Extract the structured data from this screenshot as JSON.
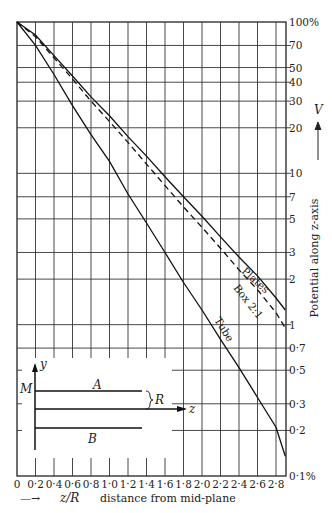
{
  "chart_data": {
    "type": "line",
    "title": "",
    "xlabel": "z/R  distance from mid-plane",
    "xlabel_parts": {
      "arrow": "—→",
      "var": "z/R",
      "text": "distance from mid-plane"
    },
    "ylabel": "Potential along z-axis",
    "ylabel_var": "V",
    "yscale": "log",
    "xlim": [
      0,
      2.9
    ],
    "ylim": [
      0.1,
      100
    ],
    "grid": true,
    "x_ticks": [
      "0",
      "0·2",
      "0·4",
      "0·6",
      "0·8",
      "1·0",
      "1·2",
      "1·4",
      "1·6",
      "1·8",
      "2·0",
      "2·2",
      "2·4",
      "2·6",
      "2·8"
    ],
    "x_tick_values": [
      0,
      0.2,
      0.4,
      0.6,
      0.8,
      1.0,
      1.2,
      1.4,
      1.6,
      1.8,
      2.0,
      2.2,
      2.4,
      2.6,
      2.8
    ],
    "y_ticks": [
      {
        "value": 100,
        "label": "100%"
      },
      {
        "value": 70,
        "label": "70"
      },
      {
        "value": 50,
        "label": "50"
      },
      {
        "value": 40,
        "label": "40"
      },
      {
        "value": 30,
        "label": "30"
      },
      {
        "value": 20,
        "label": "20"
      },
      {
        "value": 10,
        "label": "10"
      },
      {
        "value": 7,
        "label": "7"
      },
      {
        "value": 5,
        "label": "5"
      },
      {
        "value": 3,
        "label": "3"
      },
      {
        "value": 2,
        "label": "2"
      },
      {
        "value": 1,
        "label": "1"
      },
      {
        "value": 0.7,
        "label": "0·7"
      },
      {
        "value": 0.5,
        "label": "0·5"
      },
      {
        "value": 0.3,
        "label": "0·3"
      },
      {
        "value": 0.2,
        "label": "0·2"
      },
      {
        "value": 0.1,
        "label": "0·1%"
      }
    ],
    "x": [
      0,
      0.2,
      0.4,
      0.6,
      0.8,
      1.0,
      1.2,
      1.4,
      1.6,
      1.8,
      2.0,
      2.2,
      2.4,
      2.6,
      2.8,
      2.9
    ],
    "series": [
      {
        "name": "Plates",
        "style": "solid",
        "values": [
          100,
          82,
          60,
          44,
          32,
          24,
          17.5,
          13,
          9.5,
          7,
          5.2,
          3.8,
          2.8,
          2.1,
          1.5,
          1.25
        ]
      },
      {
        "name": "Box 2:1",
        "style": "dashed",
        "values": [
          100,
          80,
          58,
          42,
          30,
          22,
          16,
          11.5,
          8.3,
          6,
          4.4,
          3.2,
          2.3,
          1.7,
          1.2,
          0.95
        ]
      },
      {
        "name": "Tube",
        "style": "solid",
        "values": [
          100,
          70,
          45,
          28,
          18,
          12,
          7.3,
          4.7,
          3.0,
          1.9,
          1.25,
          0.8,
          0.52,
          0.33,
          0.21,
          0.135
        ]
      }
    ],
    "annotations": [
      {
        "text": "Plates",
        "near": {
          "x": 2.5,
          "y": 2.2
        }
      },
      {
        "text": "Box 2:1",
        "near": {
          "x": 2.3,
          "y": 1.7
        }
      },
      {
        "text": "Tube",
        "near": {
          "x": 2.2,
          "y": 0.75
        }
      }
    ],
    "inset": {
      "labels": {
        "y_axis": "y",
        "z_axis": "z",
        "plane": "M",
        "upper": "A",
        "lower": "B",
        "gap": "R"
      }
    }
  }
}
